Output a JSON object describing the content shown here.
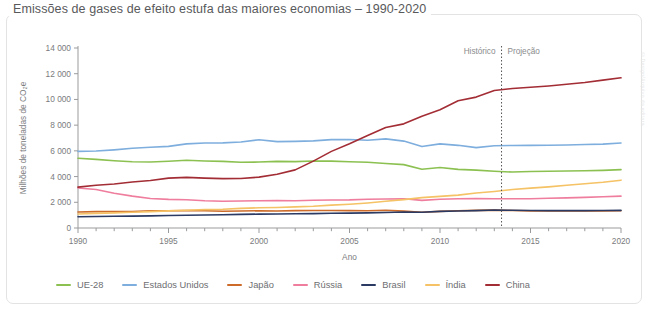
{
  "title": "Emissões de gases de efeito estufa das maiores economias – 1990-2020",
  "watermark": "©Design/Arquivo da editora",
  "annotations": {
    "historico": "Histórico",
    "projecao": "Projeção",
    "divider_year": 2013.4
  },
  "legend": {
    "items": [
      {
        "label": "UE-28",
        "color": "#8cc152"
      },
      {
        "label": "Estados Unidos",
        "color": "#7eaedd"
      },
      {
        "label": "Japão",
        "color": "#cc6b2a"
      },
      {
        "label": "Rússia",
        "color": "#ef7d9d"
      },
      {
        "label": "Brasil",
        "color": "#2b3a63"
      },
      {
        "label": "Índia",
        "color": "#f5c265"
      },
      {
        "label": "China",
        "color": "#a32d35"
      }
    ]
  },
  "chart_data": {
    "type": "line",
    "title": "Emissões de gases de efeito estufa das maiores economias – 1990-2020",
    "xlabel": "Ano",
    "ylabel": "Milhões de toneladas de CO₂e",
    "xlim": [
      1990,
      2020
    ],
    "ylim": [
      0,
      14000
    ],
    "xticks": [
      1990,
      1995,
      2000,
      2005,
      2010,
      2015,
      2020
    ],
    "yticks": [
      0,
      2000,
      4000,
      6000,
      8000,
      10000,
      12000,
      14000
    ],
    "ytick_labels": [
      "0",
      "2 000",
      "4 000",
      "6 000",
      "8 000",
      "10 000",
      "12 000",
      "14 000"
    ],
    "grid": false,
    "legend_position": "bottom",
    "x": [
      1990,
      1991,
      1992,
      1993,
      1994,
      1995,
      1996,
      1997,
      1998,
      1999,
      2000,
      2001,
      2002,
      2003,
      2004,
      2005,
      2006,
      2007,
      2008,
      2009,
      2010,
      2011,
      2012,
      2013,
      2014,
      2015,
      2016,
      2017,
      2018,
      2019,
      2020
    ],
    "series": [
      {
        "name": "UE-28",
        "color": "#8cc152",
        "values": [
          5420,
          5340,
          5230,
          5150,
          5130,
          5190,
          5270,
          5210,
          5180,
          5110,
          5130,
          5180,
          5160,
          5210,
          5200,
          5150,
          5110,
          5020,
          4930,
          4570,
          4700,
          4560,
          4500,
          4410,
          4350,
          4390,
          4410,
          4430,
          4450,
          4480,
          4540
        ]
      },
      {
        "name": "Estados Unidos",
        "color": "#7eaedd",
        "values": [
          5960,
          5990,
          6080,
          6200,
          6280,
          6350,
          6540,
          6610,
          6620,
          6690,
          6860,
          6720,
          6740,
          6780,
          6870,
          6880,
          6830,
          6930,
          6760,
          6340,
          6540,
          6430,
          6250,
          6400,
          6420,
          6430,
          6440,
          6460,
          6490,
          6520,
          6610
        ]
      },
      {
        "name": "Japão",
        "color": "#cc6b2a",
        "values": [
          1250,
          1270,
          1280,
          1280,
          1330,
          1340,
          1350,
          1340,
          1300,
          1320,
          1340,
          1320,
          1350,
          1360,
          1360,
          1350,
          1340,
          1380,
          1310,
          1220,
          1290,
          1340,
          1370,
          1390,
          1360,
          1330,
          1320,
          1320,
          1320,
          1330,
          1340
        ]
      },
      {
        "name": "Rússia",
        "color": "#ef7d9d",
        "values": [
          3110,
          3000,
          2700,
          2480,
          2300,
          2230,
          2200,
          2120,
          2080,
          2100,
          2120,
          2130,
          2120,
          2160,
          2180,
          2190,
          2240,
          2260,
          2280,
          2150,
          2240,
          2280,
          2300,
          2280,
          2270,
          2280,
          2310,
          2340,
          2380,
          2430,
          2480
        ]
      },
      {
        "name": "Brasil",
        "color": "#2b3a63",
        "values": [
          880,
          900,
          910,
          920,
          940,
          970,
          990,
          1010,
          1030,
          1060,
          1080,
          1090,
          1110,
          1120,
          1150,
          1160,
          1180,
          1210,
          1250,
          1230,
          1290,
          1320,
          1350,
          1400,
          1380,
          1360,
          1350,
          1350,
          1350,
          1360,
          1370
        ]
      },
      {
        "name": "Índia",
        "color": "#f5c265",
        "values": [
          1090,
          1140,
          1180,
          1220,
          1270,
          1330,
          1380,
          1430,
          1460,
          1530,
          1570,
          1600,
          1640,
          1690,
          1780,
          1850,
          1950,
          2080,
          2210,
          2360,
          2460,
          2560,
          2720,
          2840,
          2990,
          3100,
          3200,
          3320,
          3440,
          3560,
          3720
        ]
      },
      {
        "name": "China",
        "color": "#a32d35",
        "values": [
          3180,
          3330,
          3420,
          3580,
          3700,
          3880,
          3940,
          3880,
          3840,
          3850,
          3960,
          4180,
          4520,
          5200,
          5960,
          6560,
          7200,
          7820,
          8100,
          8700,
          9200,
          9900,
          10180,
          10700,
          10850,
          10950,
          11050,
          11180,
          11320,
          11500,
          11680
        ]
      }
    ]
  }
}
